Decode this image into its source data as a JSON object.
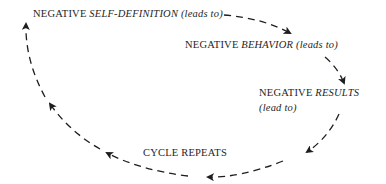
{
  "diagram": {
    "type": "cycle",
    "nodes": [
      {
        "id": "self_definition",
        "prefix": "NEGATIVE",
        "emphasis": "SELF-DEFINITION",
        "suffix": "(leads to)"
      },
      {
        "id": "behavior",
        "prefix": "NEGATIVE",
        "emphasis": "BEHAVIOR",
        "suffix": "(leads to)"
      },
      {
        "id": "results",
        "prefix": "NEGATIVE",
        "emphasis": "RESULTS",
        "suffix": "(lead to)"
      },
      {
        "id": "cycle_repeats",
        "label": "CYCLE REPEATS"
      }
    ],
    "edges": [
      {
        "from": "self_definition",
        "to": "behavior",
        "style": "dashed-arrow"
      },
      {
        "from": "behavior",
        "to": "results",
        "style": "dashed-arrow"
      },
      {
        "from": "results",
        "to": "cycle_repeats",
        "style": "dashed-arrow"
      },
      {
        "from": "cycle_repeats",
        "to": "self_definition",
        "style": "dashed-arrow"
      }
    ],
    "colors": {
      "stroke": "#1e1e1e",
      "background": "#ffffff"
    }
  }
}
